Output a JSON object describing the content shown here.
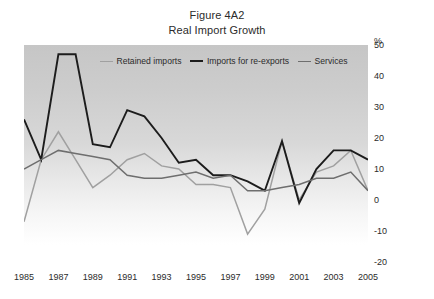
{
  "figure": {
    "title_lines": [
      "Figure 4A2",
      "Real Import Growth"
    ],
    "unit_label": "%"
  },
  "legend": {
    "position": "top-center",
    "items": [
      {
        "label": "Retained imports",
        "color": "#a0a0a0"
      },
      {
        "label": "Imports for re-exports",
        "color": "#1c1c1c"
      },
      {
        "label": "Services",
        "color": "#6e6e6e"
      }
    ]
  },
  "chart_data": {
    "type": "line",
    "subtitle": "Real Import Growth",
    "xlabel": "",
    "ylabel": "%",
    "ylim": [
      -20,
      50
    ],
    "xlim": [
      1985,
      2005
    ],
    "grid": false,
    "y_ticks": [
      50,
      40,
      30,
      20,
      10,
      0,
      -10,
      -20
    ],
    "x_ticks": [
      1985,
      1987,
      1989,
      1991,
      1993,
      1995,
      1997,
      1999,
      2001,
      2003,
      2005
    ],
    "x": [
      1985,
      1986,
      1987,
      1988,
      1989,
      1990,
      1991,
      1992,
      1993,
      1994,
      1995,
      1996,
      1997,
      1998,
      1999,
      2000,
      2001,
      2002,
      2003,
      2004,
      2005
    ],
    "series": [
      {
        "name": "Retained imports",
        "color": "#a0a0a0",
        "values": [
          -7,
          13,
          22,
          13,
          4,
          8,
          13,
          15,
          11,
          10,
          5,
          5,
          4,
          -11,
          -3,
          19,
          0,
          9,
          11,
          16,
          3
        ]
      },
      {
        "name": "Imports for re-exports",
        "color": "#1c1c1c",
        "values": [
          26,
          13,
          47,
          47,
          18,
          17,
          29,
          27,
          20,
          12,
          13,
          8,
          8,
          6,
          3,
          19,
          -1,
          10,
          16,
          16,
          13
        ]
      },
      {
        "name": "Services",
        "color": "#6e6e6e",
        "values": [
          10,
          13,
          16,
          15,
          14,
          13,
          8,
          7,
          7,
          8,
          9,
          7,
          8,
          3,
          3,
          4,
          5,
          7,
          7,
          9,
          3
        ]
      }
    ]
  }
}
